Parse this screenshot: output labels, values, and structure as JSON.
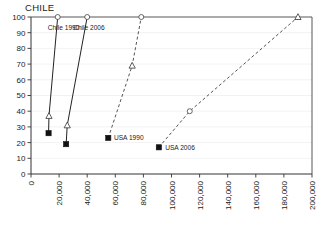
{
  "chart_data": {
    "type": "line",
    "title": "CHILE",
    "xlabel": "",
    "ylabel": "",
    "xlim": [
      0,
      200000
    ],
    "ylim": [
      0,
      100
    ],
    "grid": false,
    "legend_position": "inline-annotations",
    "x_ticks": [
      "0",
      "20,000",
      "40,000",
      "60,000",
      "80,000",
      "100,000",
      "120,000",
      "140,000",
      "160,000",
      "180,000",
      "200,000"
    ],
    "x_tick_values": [
      0,
      20000,
      40000,
      60000,
      80000,
      100000,
      120000,
      140000,
      160000,
      180000,
      200000
    ],
    "y_ticks": [
      "0",
      "10",
      "20",
      "30",
      "40",
      "50",
      "60",
      "70",
      "80",
      "90",
      "100"
    ],
    "y_tick_values": [
      0,
      10,
      20,
      30,
      40,
      50,
      60,
      70,
      80,
      90,
      100
    ],
    "series": [
      {
        "name": "Chile 1990",
        "line_style": "solid",
        "label_x": 12000,
        "label_y": 93,
        "points": [
          {
            "x": 12500,
            "y": 26,
            "marker": "square"
          },
          {
            "x": 12800,
            "y": 37,
            "marker": "triangle"
          },
          {
            "x": 19000,
            "y": 100,
            "marker": "circle"
          }
        ]
      },
      {
        "name": "Chile 2006",
        "line_style": "solid",
        "label_x": 30000,
        "label_y": 93,
        "points": [
          {
            "x": 25000,
            "y": 19,
            "marker": "square"
          },
          {
            "x": 25800,
            "y": 31,
            "marker": "triangle"
          },
          {
            "x": 40000,
            "y": 100,
            "marker": "circle"
          }
        ]
      },
      {
        "name": "USA 1990",
        "line_style": "dashed",
        "label_x": 59000,
        "label_y": 23,
        "points": [
          {
            "x": 55000,
            "y": 23,
            "marker": "square"
          },
          {
            "x": 72000,
            "y": 69,
            "marker": "triangle"
          },
          {
            "x": 78500,
            "y": 100,
            "marker": "circle"
          }
        ]
      },
      {
        "name": "USA 2006",
        "line_style": "dashed",
        "label_x": 95500,
        "label_y": 17,
        "points": [
          {
            "x": 91000,
            "y": 17,
            "marker": "square"
          },
          {
            "x": 113000,
            "y": 40,
            "marker": "circle"
          },
          {
            "x": 190000,
            "y": 100,
            "marker": "triangle"
          }
        ]
      }
    ]
  },
  "colors": {
    "axis": "#333333",
    "solid_series": "#222222",
    "dashed_series": "#555555",
    "marker_fill_dark": "#111111",
    "marker_fill_light": "#ffffff",
    "background": "#ffffff"
  }
}
